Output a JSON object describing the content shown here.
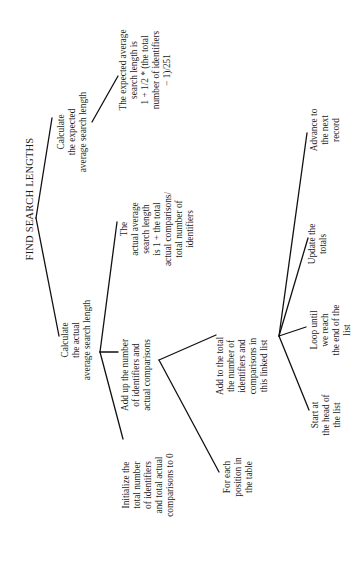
{
  "diagram": {
    "title": "FIND SEARCH LENGTHS",
    "orientation": "rotated -90deg (reads bottom-to-top)",
    "nodes": {
      "root": {
        "label": "FIND SEARCH LENGTHS"
      },
      "calc_expected": {
        "label": "Calculate\nthe expected\naverage search length"
      },
      "expected_formula": {
        "label": "The expected average\nsearch length is\n1 + 1/2 * (the total\nnumber of identifiers\n− 1)/251"
      },
      "calc_actual": {
        "label": "Calculate\nthe actual\naverage search length"
      },
      "actual_formula": {
        "label": "The\nactual average\nsearch length\nis 1 + the total\nactual comparisons/\ntotal number of\nidentifiers"
      },
      "add_up": {
        "label": "Add up the number\nof identifiers and\nactual comparisons"
      },
      "initialize": {
        "label": "Initialize the\ntotal number\nof identifiers\nand total actual\ncomparisons to 0"
      },
      "for_each": {
        "label": "For each\nposition in\nthe table"
      },
      "add_to_total": {
        "label": "Add to the total\nthe number of\nidentifiers and\ncomparisons in\nthis linked list"
      },
      "start_head": {
        "label": "Start at\nthe head of\nthe list"
      },
      "loop_until": {
        "label": "Loop until\nwe reach\nthe end of the\nlist"
      },
      "update_totals": {
        "label": "Update the\ntotals"
      },
      "advance": {
        "label": "Advance to\nthe next\nrecord"
      }
    },
    "edges": [
      [
        "root",
        "calc_expected"
      ],
      [
        "root",
        "calc_actual"
      ],
      [
        "calc_expected",
        "expected_formula"
      ],
      [
        "calc_actual",
        "actual_formula"
      ],
      [
        "calc_actual",
        "add_up"
      ],
      [
        "calc_actual",
        "initialize"
      ],
      [
        "add_up",
        "add_to_total"
      ],
      [
        "add_up",
        "for_each"
      ],
      [
        "add_to_total",
        "start_head"
      ],
      [
        "add_to_total",
        "loop_until"
      ],
      [
        "add_to_total",
        "update_totals"
      ],
      [
        "add_to_total",
        "advance"
      ]
    ],
    "line_color": "#111111",
    "background": "#ffffff"
  }
}
